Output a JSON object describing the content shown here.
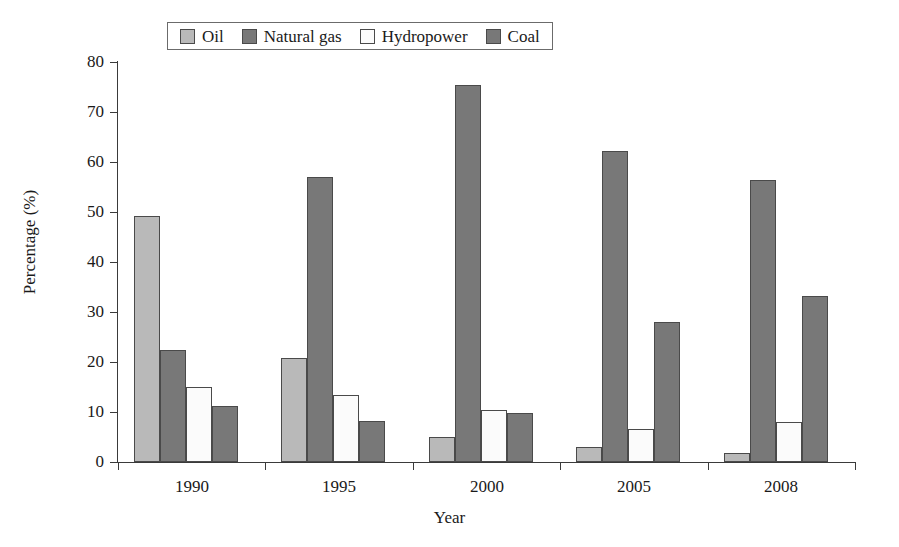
{
  "chart_data": {
    "type": "bar",
    "title": "",
    "xlabel": "Year",
    "ylabel": "Percentage (%)",
    "categories": [
      "1990",
      "1995",
      "2000",
      "2005",
      "2008"
    ],
    "ylim": [
      0,
      80
    ],
    "yticks": [
      0,
      10,
      20,
      30,
      40,
      50,
      60,
      70,
      80
    ],
    "ytick_labels": [
      "0",
      "10",
      "20",
      "30",
      "40",
      "50",
      "60",
      "70",
      "80"
    ],
    "grid": false,
    "legend_position": "top-center",
    "series": [
      {
        "name": "Oil",
        "color": "#b9b9b9",
        "values": [
          49.2,
          20.8,
          5.0,
          3.0,
          1.9
        ]
      },
      {
        "name": "Natural gas",
        "color": "#787878",
        "values": [
          22.4,
          57.0,
          75.4,
          62.2,
          56.5
        ]
      },
      {
        "name": "Hydropower",
        "color": "#fbfbfb",
        "values": [
          15.0,
          13.4,
          10.4,
          6.6,
          8.0
        ]
      },
      {
        "name": "Coal",
        "color": "#787878",
        "values": [
          11.2,
          8.3,
          9.8,
          28.0,
          33.2
        ]
      }
    ]
  },
  "axes": {
    "y_title": "Percentage (%)",
    "x_title": "Year"
  },
  "legend": {
    "entries": [
      {
        "label": "Oil",
        "swatch": "#b9b9b9"
      },
      {
        "label": "Natural gas",
        "swatch": "#787878"
      },
      {
        "label": "Hydropower",
        "swatch": "#fbfbfb"
      },
      {
        "label": "Coal",
        "swatch": "#787878"
      }
    ]
  }
}
